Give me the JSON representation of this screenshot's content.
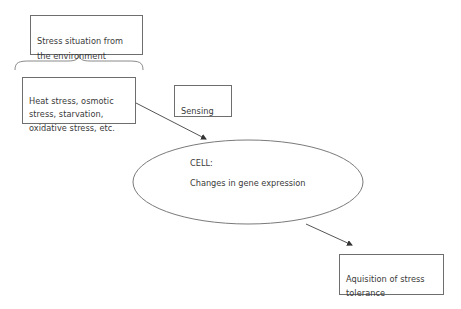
{
  "diagram": {
    "nodes": {
      "environment": {
        "label": "Stress situation from\nthe environment"
      },
      "stress_types": {
        "label": "Heat stress, osmotic\nstress, starvation,\noxidative stress, etc."
      },
      "sensing": {
        "label": "Sensing"
      },
      "cell": {
        "title": "CELL:",
        "subtitle": "Changes in gene expression"
      },
      "tolerance": {
        "label": "Aquisition of stress\ntolerance"
      }
    },
    "edges": [
      {
        "from": "stress_types",
        "to": "cell",
        "type": "arrow"
      },
      {
        "from": "cell",
        "to": "tolerance",
        "type": "arrow"
      }
    ],
    "colors": {
      "stroke": "#6e6e6e",
      "text": "#3a3a3a",
      "background": "#ffffff"
    }
  }
}
